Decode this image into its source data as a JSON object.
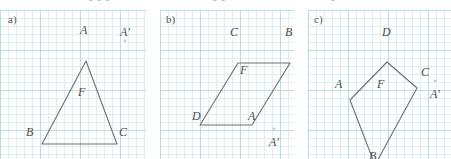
{
  "figure": {
    "title_fragments": [
      {
        "text": "0 0 0",
        "x": 88
      },
      {
        "text": "0 0",
        "x": 212
      },
      {
        "text": "0",
        "x": 330
      }
    ],
    "grid": {
      "minor_spacing_px": 8,
      "major_spacing_px": 40,
      "minor_color": "#dcf0f2",
      "major_color": "#b9dde1",
      "background": "#ffffff"
    },
    "stroke_color": "#6e6e70",
    "label_color": "#4c4c4c"
  },
  "panels": [
    {
      "id": "a",
      "tag": "a)",
      "tag_pos": {
        "x": 8,
        "y": 14
      },
      "shape_name": "triangle",
      "interior_label": "F",
      "interior_label_pos": {
        "x": 78,
        "y": 92
      },
      "points": "86,41 42,124 117,124",
      "vertices": [
        {
          "name": "A",
          "x": 86,
          "y": 41,
          "label_x": 80,
          "label_y": 24
        },
        {
          "name": "B",
          "x": 42,
          "y": 124,
          "label_x": 26,
          "label_y": 126
        },
        {
          "name": "C",
          "x": 117,
          "y": 124,
          "label_x": 119,
          "label_y": 126
        }
      ],
      "image_point": {
        "name": "A'",
        "label_x": 120,
        "label_y": 26,
        "cross": "×",
        "cross_x": 123,
        "cross_y": 38
      }
    },
    {
      "id": "b",
      "tag": "b)",
      "tag_pos": {
        "x": 166,
        "y": 14
      },
      "shape_name": "parallelogram",
      "interior_label": "F",
      "interior_label_pos": {
        "x": 240,
        "y": 70
      },
      "points": "238,43 290,43 252,105 200,105",
      "vertices": [
        {
          "name": "C",
          "x": 238,
          "y": 43,
          "label_x": 230,
          "label_y": 26
        },
        {
          "name": "B",
          "x": 290,
          "y": 43,
          "label_x": 285,
          "label_y": 26
        },
        {
          "name": "A",
          "x": 252,
          "y": 105,
          "label_x": 248,
          "label_y": 110
        },
        {
          "name": "D",
          "x": 200,
          "y": 105,
          "label_x": 192,
          "label_y": 110
        }
      ],
      "image_point": {
        "name": "A'",
        "label_x": 269,
        "label_y": 136,
        "cross": "×",
        "cross_x": 272,
        "cross_y": 126
      }
    },
    {
      "id": "c",
      "tag": "c)",
      "tag_pos": {
        "x": 314,
        "y": 14
      },
      "shape_name": "kite",
      "interior_label": "F",
      "interior_label_pos": {
        "x": 377,
        "y": 84
      },
      "points": "387,42 417,68 375,145 350,80",
      "vertices": [
        {
          "name": "D",
          "x": 387,
          "y": 42,
          "label_x": 382,
          "label_y": 26
        },
        {
          "name": "C",
          "x": 417,
          "y": 68,
          "label_x": 421,
          "label_y": 66
        },
        {
          "name": "B",
          "x": 375,
          "y": 145,
          "label_x": 369,
          "label_y": 150
        },
        {
          "name": "A",
          "x": 350,
          "y": 80,
          "label_x": 335,
          "label_y": 78
        }
      ],
      "image_point": {
        "name": "A'",
        "label_x": 430,
        "label_y": 88,
        "cross": "×",
        "cross_x": 433,
        "cross_y": 78
      }
    }
  ]
}
